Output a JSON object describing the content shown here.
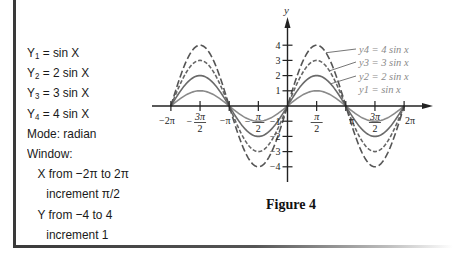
{
  "calculator_panel": {
    "equations": [
      {
        "lhs": "Y",
        "sub": "1",
        "rhs": " = sin X"
      },
      {
        "lhs": "Y",
        "sub": "2",
        "rhs": " = 2 sin X"
      },
      {
        "lhs": "Y",
        "sub": "3",
        "rhs": " = 3 sin X"
      },
      {
        "lhs": "Y",
        "sub": "4",
        "rhs": " = 4 sin X"
      }
    ],
    "mode": "Mode: radian",
    "window_label": "Window:",
    "x_range": "X from −2π to 2π",
    "x_increment": "increment π/2",
    "y_range": "Y from −4 to 4",
    "y_increment": "increment 1"
  },
  "figure": {
    "caption": "Figure 4",
    "y_axis_label": "y"
  },
  "chart_data": {
    "type": "line",
    "title": "Figure 4",
    "xlabel": "",
    "ylabel": "y",
    "xlim": [
      -6.2832,
      6.2832
    ],
    "ylim": [
      -4,
      4
    ],
    "x_ticks": [
      "−2π",
      "−3π/2",
      "−π",
      "−π/2",
      "0",
      "π/2",
      "π",
      "3π/2",
      "2π"
    ],
    "x_tick_values": [
      -6.2832,
      -4.7124,
      -3.1416,
      -1.5708,
      0,
      1.5708,
      3.1416,
      4.7124,
      6.2832
    ],
    "y_ticks": [
      "−4",
      "−3",
      "−2",
      "−1",
      "1",
      "2",
      "3",
      "4"
    ],
    "y_tick_values": [
      -4,
      -3,
      -2,
      -1,
      1,
      2,
      3,
      4
    ],
    "grid": false,
    "legend_position": "annotated labels right of first positive peak",
    "series": [
      {
        "name": "y1 = sin x",
        "amplitude": 1,
        "style": "solid",
        "color": "#8a8a8a",
        "x": [
          -6.2832,
          -4.7124,
          -3.1416,
          -1.5708,
          0,
          1.5708,
          3.1416,
          4.7124,
          6.2832
        ],
        "values": [
          0,
          1,
          0,
          -1,
          0,
          1,
          0,
          -1,
          0
        ]
      },
      {
        "name": "y2 = 2 sin x",
        "amplitude": 2,
        "style": "solid",
        "color": "#6a6a6a",
        "x": [
          -6.2832,
          -4.7124,
          -3.1416,
          -1.5708,
          0,
          1.5708,
          3.1416,
          4.7124,
          6.2832
        ],
        "values": [
          0,
          2,
          0,
          -2,
          0,
          2,
          0,
          -2,
          0
        ]
      },
      {
        "name": "y3 = 3 sin x",
        "amplitude": 3,
        "style": "short-dash",
        "color": "#666666",
        "x": [
          -6.2832,
          -4.7124,
          -3.1416,
          -1.5708,
          0,
          1.5708,
          3.1416,
          4.7124,
          6.2832
        ],
        "values": [
          0,
          3,
          0,
          -3,
          0,
          3,
          0,
          -3,
          0
        ]
      },
      {
        "name": "y4 = 4 sin x",
        "amplitude": 4,
        "style": "long-dash",
        "color": "#555555",
        "x": [
          -6.2832,
          -4.7124,
          -3.1416,
          -1.5708,
          0,
          1.5708,
          3.1416,
          4.7124,
          6.2832
        ],
        "values": [
          0,
          4,
          0,
          -4,
          0,
          4,
          0,
          -4,
          0
        ]
      }
    ],
    "annotations": [
      {
        "text": "y4 = 4 sin x",
        "target": "y4"
      },
      {
        "text": "y3 = 3 sin x",
        "target": "y3"
      },
      {
        "text": "y2 = 2 sin x",
        "target": "y2"
      },
      {
        "text": "y1 = sin x",
        "target": "y1"
      }
    ]
  }
}
